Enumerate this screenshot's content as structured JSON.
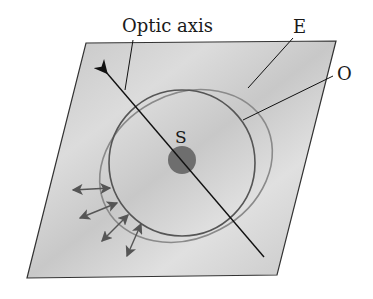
{
  "diagram": {
    "labels": {
      "optic_axis": "Optic axis",
      "extraordinary": "E",
      "ordinary": "O",
      "source": "S"
    },
    "elements": {
      "plane": "crystal-plane-parallelogram",
      "optic_axis_arrow": "optic-axis-arrow",
      "ordinary_wavefront": "circle",
      "extraordinary_wavefront": "ellipse",
      "source_point": "dot",
      "polarization_arrows": "double-headed-arrows"
    },
    "colors": {
      "plane_fill": "#cfcfcf",
      "plane_stroke": "#333333",
      "o_circle": "#555555",
      "e_ellipse": "#8a8a8a",
      "source": "#6e6e6e",
      "arrows": "#555555",
      "axis": "#111111"
    }
  }
}
